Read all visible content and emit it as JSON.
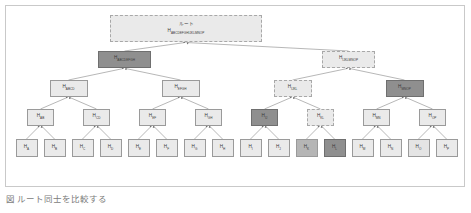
{
  "figure": {
    "caption": "図 ルート同士を比較する",
    "background_color": "#ffffff",
    "frame_color": "#c9c9c9"
  },
  "palette": {
    "light": "#eaeaea",
    "light_alt": "#e4e4e4",
    "mid": "#b5b5b5",
    "dark": "#8f8f8f",
    "border": "#9a9a9a",
    "border_dark": "#6f6f6f",
    "text": "#3a3a3a",
    "edge": "#777777"
  },
  "diagram": {
    "type": "merkle-tree",
    "root_caption": "ルート",
    "levels": [
      {
        "level": 0,
        "nodes": [
          {
            "id": "root",
            "prefix": "H",
            "subscript": "ABCDEFGHIJKLMNOP",
            "top_label": "ルート",
            "fill": "light",
            "border": "dashed"
          }
        ]
      },
      {
        "level": 1,
        "nodes": [
          {
            "id": "n-abcdefgh",
            "prefix": "H",
            "subscript": "ABCDEFGH",
            "fill": "dark",
            "border": "solid-dark"
          },
          {
            "id": "n-ijklmnop",
            "prefix": "H",
            "subscript": "IJKLMNOP",
            "fill": "light",
            "border": "dashed"
          }
        ]
      },
      {
        "level": 2,
        "nodes": [
          {
            "id": "n-abcd",
            "prefix": "H",
            "subscript": "ABCD",
            "fill": "light",
            "border": "solid"
          },
          {
            "id": "n-efgh",
            "prefix": "H",
            "subscript": "EFGH",
            "fill": "light",
            "border": "solid"
          },
          {
            "id": "n-ijkl",
            "prefix": "H",
            "subscript": "IJKL",
            "fill": "light",
            "border": "dashed"
          },
          {
            "id": "n-mnop",
            "prefix": "H",
            "subscript": "MNOP",
            "fill": "dark",
            "border": "solid-dark"
          }
        ]
      },
      {
        "level": 3,
        "nodes": [
          {
            "id": "n-ab",
            "prefix": "H",
            "subscript": "AB",
            "fill": "light",
            "border": "solid"
          },
          {
            "id": "n-cd",
            "prefix": "H",
            "subscript": "CD",
            "fill": "light",
            "border": "solid"
          },
          {
            "id": "n-ef",
            "prefix": "H",
            "subscript": "EF",
            "fill": "light",
            "border": "solid"
          },
          {
            "id": "n-gh",
            "prefix": "H",
            "subscript": "GH",
            "fill": "light",
            "border": "solid"
          },
          {
            "id": "n-ij",
            "prefix": "H",
            "subscript": "IJ",
            "fill": "dark",
            "border": "solid-dark"
          },
          {
            "id": "n-kl",
            "prefix": "H",
            "subscript": "KL",
            "fill": "light",
            "border": "dashed"
          },
          {
            "id": "n-mn",
            "prefix": "H",
            "subscript": "MN",
            "fill": "light",
            "border": "solid"
          },
          {
            "id": "n-op",
            "prefix": "H",
            "subscript": "OP",
            "fill": "light",
            "border": "solid"
          }
        ]
      },
      {
        "level": 4,
        "nodes": [
          {
            "id": "leaf-a",
            "prefix": "H",
            "subscript": "A",
            "fill": "light",
            "border": "solid"
          },
          {
            "id": "leaf-b",
            "prefix": "H",
            "subscript": "B",
            "fill": "light",
            "border": "solid"
          },
          {
            "id": "leaf-c",
            "prefix": "H",
            "subscript": "C",
            "fill": "light",
            "border": "solid"
          },
          {
            "id": "leaf-d",
            "prefix": "H",
            "subscript": "D",
            "fill": "light",
            "border": "solid"
          },
          {
            "id": "leaf-e",
            "prefix": "H",
            "subscript": "E",
            "fill": "light",
            "border": "solid"
          },
          {
            "id": "leaf-f",
            "prefix": "H",
            "subscript": "F",
            "fill": "light",
            "border": "solid"
          },
          {
            "id": "leaf-g",
            "prefix": "H",
            "subscript": "G",
            "fill": "light",
            "border": "solid"
          },
          {
            "id": "leaf-h",
            "prefix": "H",
            "subscript": "H",
            "fill": "light",
            "border": "solid"
          },
          {
            "id": "leaf-i",
            "prefix": "H",
            "subscript": "I",
            "fill": "light",
            "border": "solid"
          },
          {
            "id": "leaf-j",
            "prefix": "H",
            "subscript": "J",
            "fill": "light",
            "border": "solid"
          },
          {
            "id": "leaf-k",
            "prefix": "H",
            "subscript": "K",
            "fill": "mid",
            "border": "solid"
          },
          {
            "id": "leaf-l",
            "prefix": "H",
            "subscript": "L",
            "fill": "dark",
            "border": "solid-dark"
          },
          {
            "id": "leaf-m",
            "prefix": "H",
            "subscript": "M",
            "fill": "light",
            "border": "solid"
          },
          {
            "id": "leaf-n",
            "prefix": "H",
            "subscript": "N",
            "fill": "light",
            "border": "solid"
          },
          {
            "id": "leaf-o",
            "prefix": "H",
            "subscript": "O",
            "fill": "light_alt",
            "border": "solid"
          },
          {
            "id": "leaf-p",
            "prefix": "H",
            "subscript": "P",
            "fill": "light",
            "border": "solid"
          }
        ]
      }
    ]
  }
}
